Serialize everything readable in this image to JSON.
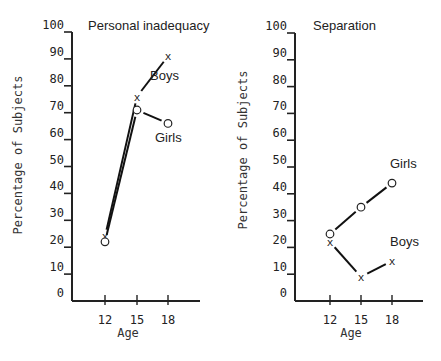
{
  "chart_data": [
    {
      "type": "line",
      "title": "Personal inadequacy",
      "xlabel": "Age",
      "ylabel": "Percentage of Subjects",
      "x": [
        12,
        15,
        18
      ],
      "ylim": [
        0,
        100
      ],
      "yticks": [
        0,
        10,
        20,
        30,
        40,
        50,
        60,
        70,
        80,
        90,
        100
      ],
      "xticks": [
        12,
        15,
        18
      ],
      "grid": false,
      "series": [
        {
          "name": "Boys",
          "marker": "x",
          "values": [
            24,
            76,
            91
          ]
        },
        {
          "name": "Girls",
          "marker": "o",
          "values": [
            22,
            71,
            66
          ]
        }
      ]
    },
    {
      "type": "line",
      "title": "Separation",
      "xlabel": "Age",
      "ylabel": "Percentage of Subjects",
      "x": [
        12,
        15,
        18
      ],
      "ylim": [
        0,
        100
      ],
      "yticks": [
        0,
        10,
        20,
        30,
        40,
        50,
        60,
        70,
        80,
        90,
        100
      ],
      "xticks": [
        12,
        15,
        18
      ],
      "grid": false,
      "series": [
        {
          "name": "Girls",
          "marker": "o",
          "values": [
            25,
            35,
            44
          ]
        },
        {
          "name": "Boys",
          "marker": "x",
          "values": [
            22,
            9,
            15
          ]
        }
      ]
    }
  ],
  "panels": [
    {
      "title": "Personal inadequacy",
      "xlabel": "Age",
      "ylabel": "Percentage of Subjects",
      "boys_label": "Boys",
      "girls_label": "Girls"
    },
    {
      "title": "Separation",
      "xlabel": "Age",
      "ylabel": "Percentage of Subjects",
      "boys_label": "Boys",
      "girls_label": "Girls"
    }
  ]
}
